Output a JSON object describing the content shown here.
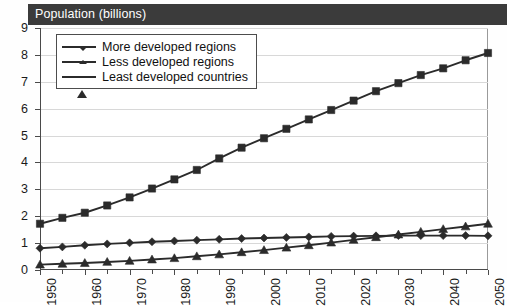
{
  "chart": {
    "title": "Population (billions)"
  },
  "legend": {
    "items": [
      {
        "label": "More developed regions",
        "marker": "diamond-marker",
        "color": "#2b2b2b"
      },
      {
        "label": "Less developed regions",
        "marker": "square-marker",
        "color": "#2b2b2b"
      },
      {
        "label": "Least developed countries",
        "marker": "triangle-marker",
        "color": "#2b2b2b"
      }
    ]
  },
  "axes": {
    "y_tick_labels": [
      "9",
      "8",
      "7",
      "6",
      "5",
      "4",
      "3",
      "2",
      "1",
      "0"
    ],
    "x_tick_labels": [
      "1950",
      "1960",
      "1970",
      "1980",
      "1990",
      "2000",
      "2010",
      "2020",
      "2030",
      "2040",
      "2050"
    ]
  },
  "chart_data": {
    "type": "line",
    "title": "Population (billions)",
    "xlabel": "",
    "ylabel": "Population (billions)",
    "xlim": [
      1950,
      2050
    ],
    "ylim": [
      0,
      9
    ],
    "y_ticks": [
      0,
      1,
      2,
      3,
      4,
      5,
      6,
      7,
      8,
      9
    ],
    "x_ticks": [
      1950,
      1960,
      1970,
      1980,
      1990,
      2000,
      2010,
      2020,
      2030,
      2040,
      2050
    ],
    "x_minor_tick_step": 5,
    "grid": true,
    "legend_position": "top-left",
    "x": [
      1950,
      1955,
      1960,
      1965,
      1970,
      1975,
      1980,
      1985,
      1990,
      1995,
      2000,
      2005,
      2010,
      2015,
      2020,
      2025,
      2030,
      2035,
      2040,
      2045,
      2050
    ],
    "series": [
      {
        "name": "More developed regions",
        "marker": "diamond",
        "values": [
          0.81,
          0.86,
          0.92,
          0.97,
          1.01,
          1.05,
          1.08,
          1.11,
          1.14,
          1.17,
          1.19,
          1.21,
          1.23,
          1.25,
          1.26,
          1.27,
          1.28,
          1.28,
          1.28,
          1.28,
          1.27
        ]
      },
      {
        "name": "Less developed regions",
        "marker": "square",
        "values": [
          1.72,
          1.94,
          2.13,
          2.4,
          2.7,
          3.03,
          3.37,
          3.72,
          4.15,
          4.55,
          4.9,
          5.25,
          5.6,
          5.95,
          6.3,
          6.65,
          6.95,
          7.25,
          7.5,
          7.8,
          8.07
        ]
      },
      {
        "name": "Least developed countries",
        "marker": "triangle",
        "values": [
          0.2,
          0.23,
          0.26,
          0.3,
          0.34,
          0.39,
          0.44,
          0.51,
          0.58,
          0.66,
          0.74,
          0.83,
          0.92,
          1.02,
          1.12,
          1.22,
          1.32,
          1.42,
          1.52,
          1.62,
          1.72
        ]
      }
    ]
  }
}
